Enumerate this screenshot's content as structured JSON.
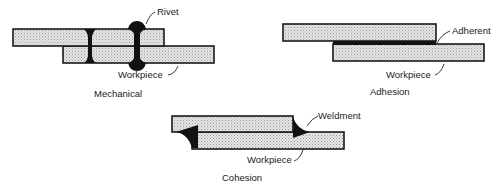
{
  "diagram": {
    "panels": [
      {
        "id": "mechanical",
        "caption": "Mechanical",
        "labels": {
          "fastener": "Rivet",
          "base": "Workpiece"
        }
      },
      {
        "id": "adhesion",
        "caption": "Adhesion",
        "labels": {
          "fastener": "Adherent",
          "base": "Workpiece"
        }
      },
      {
        "id": "cohesion",
        "caption": "Cohesion",
        "labels": {
          "fastener": "Weldment",
          "base": "Workpiece"
        }
      }
    ],
    "colors": {
      "plate_fill": "#d9d9d9",
      "outline": "#1a1a1a",
      "joint": "#111111",
      "background": "#ffffff"
    }
  }
}
